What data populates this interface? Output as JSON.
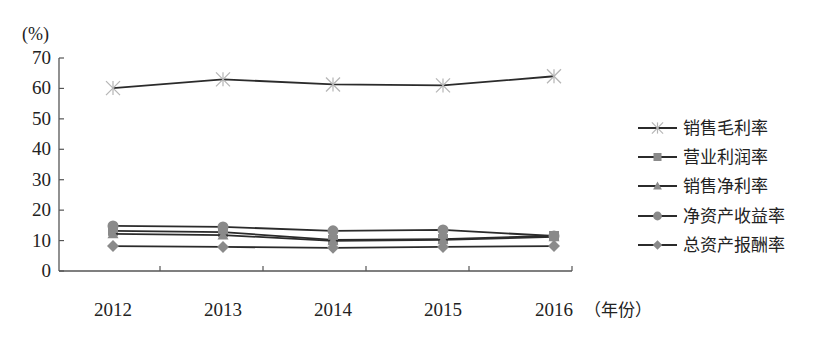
{
  "chart_data": {
    "type": "line",
    "title": "",
    "ylabel": "(%)",
    "xlabel": "（年份）",
    "categories": [
      "2012",
      "2013",
      "2014",
      "2015",
      "2016"
    ],
    "ylim": [
      0,
      70
    ],
    "yticks": [
      0,
      10,
      20,
      30,
      40,
      50,
      60,
      70
    ],
    "grid": false,
    "legend_position": "right",
    "series": [
      {
        "name": "销售毛利率",
        "marker": "asterisk",
        "values": [
          60.1,
          63.0,
          61.3,
          61.0,
          64.0
        ]
      },
      {
        "name": "营业利润率",
        "marker": "square",
        "values": [
          13.2,
          12.8,
          10.2,
          10.5,
          11.5
        ]
      },
      {
        "name": "销售净利率",
        "marker": "triangle",
        "values": [
          12.2,
          11.8,
          9.9,
          10.2,
          11.2
        ]
      },
      {
        "name": "净资产收益率",
        "marker": "circle",
        "values": [
          14.8,
          14.5,
          13.2,
          13.5,
          11.5
        ]
      },
      {
        "name": "总资产报酬率",
        "marker": "diamond",
        "values": [
          8.2,
          7.9,
          7.6,
          7.9,
          8.2
        ]
      }
    ]
  },
  "colors": {
    "line": "#2b2b2b",
    "marker": "#8a8a8a",
    "axis": "#555555"
  }
}
